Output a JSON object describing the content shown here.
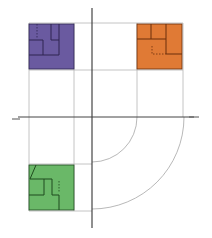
{
  "diagram": {
    "title": "",
    "origin": {
      "x": 92,
      "y": 117
    },
    "axes": {
      "vertical": {
        "x": 92,
        "y1": 8,
        "y2": 228,
        "color": "#333333"
      },
      "horizontal": {
        "y": 117,
        "x1": 18,
        "x2": 194,
        "color": "#444444"
      },
      "end_ticks": [
        {
          "x1": 12,
          "x2": 20,
          "y": 119
        },
        {
          "x1": 189,
          "x2": 199,
          "y": 117
        }
      ]
    },
    "grid": {
      "color": "#b5b5b5",
      "vertical_lines": [
        {
          "x": 29,
          "y1": 23,
          "y2": 211
        },
        {
          "x": 74,
          "y1": 23,
          "y2": 211
        },
        {
          "x": 137,
          "y1": 23,
          "y2": 117
        },
        {
          "x": 183,
          "y1": 23,
          "y2": 117
        }
      ],
      "horizontal_lines": [
        {
          "y": 23,
          "x1": 29,
          "x2": 183
        },
        {
          "y": 70,
          "x1": 29,
          "x2": 183
        },
        {
          "y": 164,
          "x1": 29,
          "x2": 92
        },
        {
          "y": 211,
          "x1": 29,
          "x2": 92
        }
      ]
    },
    "arcs": [
      {
        "name": "inner-arc",
        "radius": 45,
        "color": "#b0b0b0"
      },
      {
        "name": "outer-arc",
        "radius": 92,
        "color": "#b0b0b0"
      }
    ],
    "tiles": [
      {
        "name": "purple-tile",
        "x": 29,
        "y": 24,
        "size": 45,
        "fill": "#6a5aa0",
        "stroke": "#2e2550"
      },
      {
        "name": "orange-tile",
        "x": 137,
        "y": 24,
        "size": 45,
        "fill": "#e07a35",
        "stroke": "#6a2e0c"
      },
      {
        "name": "green-tile",
        "x": 29,
        "y": 165,
        "size": 45,
        "fill": "#6ab868",
        "stroke": "#1f4a1e"
      }
    ]
  }
}
